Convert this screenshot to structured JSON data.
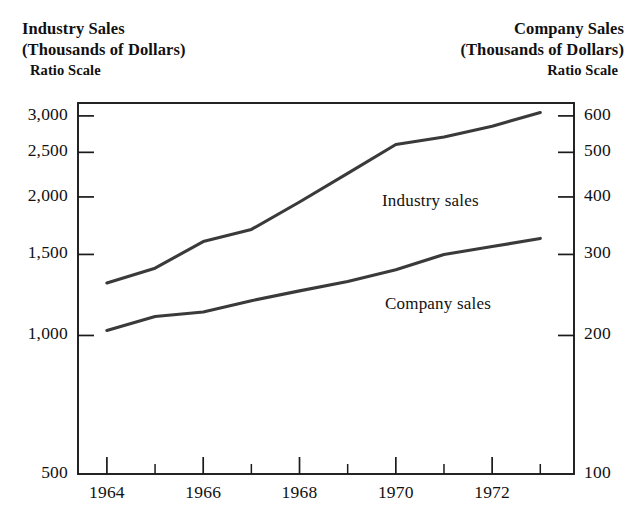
{
  "header": {
    "left": {
      "title": "Industry Sales",
      "units": "(Thousands of Dollars)",
      "scale": "Ratio Scale"
    },
    "right": {
      "title": "Company Sales",
      "units": "(Thousands of Dollars)",
      "scale": "Ratio Scale"
    }
  },
  "annotations": {
    "industry": "Industry sales",
    "company": "Company sales"
  },
  "axes": {
    "left_ticks": [
      "3,000",
      "2,500",
      "2,000",
      "1,500",
      "1,000",
      "500"
    ],
    "right_ticks": [
      "600",
      "500",
      "400",
      "300",
      "200",
      "100"
    ],
    "x_ticks": [
      "1964",
      "1966",
      "1968",
      "1970",
      "1972"
    ]
  },
  "chart_data": {
    "type": "line",
    "title": "",
    "subtitle": "",
    "xlabel": "",
    "ylabel": "Industry Sales (Thousands of Dollars)",
    "y2label": "Company Sales (Thousands of Dollars)",
    "yscale": "log",
    "y2scale": "log",
    "grid": false,
    "legend": "inline-annotation",
    "x": [
      1964,
      1965,
      1966,
      1967,
      1968,
      1969,
      1970,
      1971,
      1972,
      1973
    ],
    "xlim": [
      1963.4,
      1973.7
    ],
    "ylim": [
      500,
      3200
    ],
    "y2lim": [
      100,
      640
    ],
    "x_tick_values": [
      1964,
      1966,
      1968,
      1970,
      1972
    ],
    "x_minor_tick_values": [
      1965,
      1967,
      1969,
      1971,
      1973
    ],
    "y_tick_values": [
      3000,
      2500,
      2000,
      1500,
      1000,
      500
    ],
    "y2_tick_values": [
      600,
      500,
      400,
      300,
      200,
      100
    ],
    "series": [
      {
        "name": "Industry sales",
        "axis": "left",
        "values": [
          1300,
          1400,
          1600,
          1700,
          1950,
          2250,
          2600,
          2700,
          2850,
          3050
        ]
      },
      {
        "name": "Company sales",
        "axis": "right",
        "values": [
          205,
          220,
          225,
          238,
          250,
          262,
          278,
          300,
          312,
          325
        ]
      }
    ]
  },
  "colors": {
    "ink": "#1a1a1a",
    "background": "#ffffff",
    "line": "#3a3a3a"
  }
}
